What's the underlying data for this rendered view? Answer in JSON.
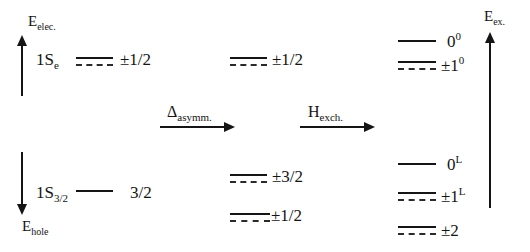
{
  "figure": {
    "type": "energy-level-diagram",
    "background_color": "#ffffff",
    "line_color": "#151515"
  },
  "axes": {
    "electron_energy": {
      "label_main": "E",
      "label_sub": "elec.",
      "direction": "up"
    },
    "hole_energy": {
      "label_main": "E",
      "label_sub": "hole",
      "direction": "down"
    },
    "exciton_energy": {
      "label_main": "E",
      "label_sub": "ex.",
      "direction": "up"
    }
  },
  "operators": [
    {
      "name": "delta-asymm",
      "label_main": "Δ",
      "label_sub": "asymm.",
      "direction": "right"
    },
    {
      "name": "h-exch",
      "label_main": "H",
      "label_sub": "exch.",
      "direction": "right"
    }
  ],
  "columns": [
    {
      "name": "unperturbed-band-edge",
      "states": [
        {
          "name": "1Se",
          "label_main": "1S",
          "label_sub": "e",
          "term": "±1/2",
          "term_sup": "",
          "lines": [
            "solid",
            "dashed"
          ]
        },
        {
          "name": "1S32",
          "label_main": "1S",
          "label_sub": "3/2",
          "term": "3/2",
          "term_sup": "",
          "lines": [
            "solid"
          ]
        }
      ]
    },
    {
      "name": "asymmetry-split",
      "states": [
        {
          "name": "electron-pm-half",
          "term": "±1/2",
          "term_sup": "",
          "lines": [
            "solid",
            "dashed"
          ]
        },
        {
          "name": "hole-pm-three-halves",
          "term": "±3/2",
          "term_sup": "",
          "lines": [
            "solid",
            "dashed"
          ]
        },
        {
          "name": "hole-pm-half",
          "term": "±1/2",
          "term_sup": "",
          "lines": [
            "solid",
            "dashed"
          ]
        }
      ]
    },
    {
      "name": "exchange-split",
      "states": [
        {
          "name": "zero-upper",
          "term": "0",
          "term_sup": "0",
          "lines": [
            "solid"
          ]
        },
        {
          "name": "pm-one-upper",
          "term": "±1",
          "term_sup": "0",
          "lines": [
            "solid",
            "dashed"
          ]
        },
        {
          "name": "zero-lower",
          "term": "0",
          "term_sup": "L",
          "lines": [
            "solid"
          ]
        },
        {
          "name": "pm-one-lower",
          "term": "±1",
          "term_sup": "L",
          "lines": [
            "solid",
            "dashed"
          ]
        },
        {
          "name": "pm-two",
          "term": "±2",
          "term_sup": "",
          "lines": [
            "solid",
            "dashed"
          ]
        }
      ]
    }
  ]
}
